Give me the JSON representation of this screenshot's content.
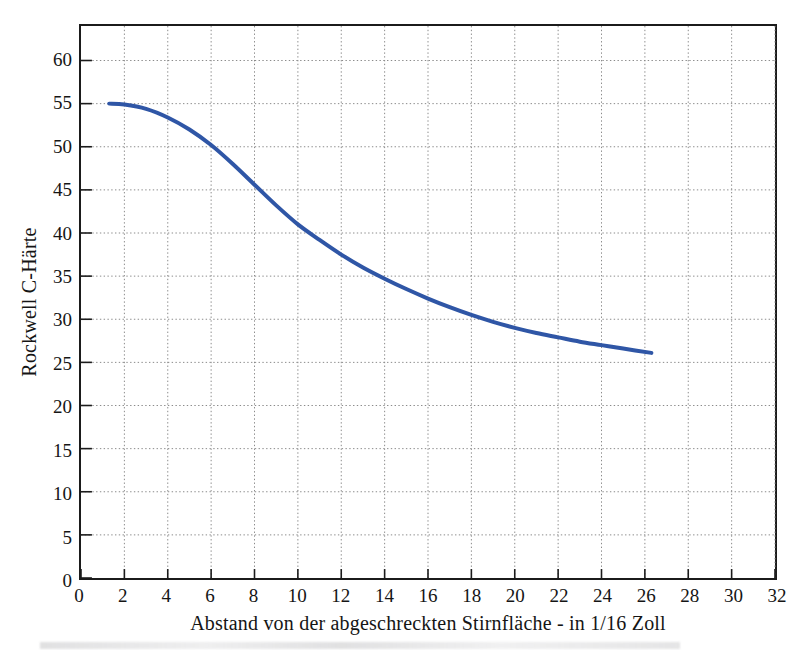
{
  "chart_data": {
    "type": "line",
    "title": "",
    "xlabel": "Abstand von der abgeschreckten Stirnfläche - in 1/16 Zoll",
    "ylabel": "Rockwell C-Härte",
    "xlim": [
      0,
      32
    ],
    "ylim": [
      0,
      64
    ],
    "xticks": [
      0,
      2,
      4,
      6,
      8,
      10,
      12,
      14,
      16,
      18,
      20,
      22,
      24,
      26,
      28,
      30,
      32
    ],
    "yticks": [
      0,
      5,
      10,
      15,
      20,
      25,
      30,
      35,
      40,
      45,
      50,
      55,
      60
    ],
    "grid": true,
    "grid_style": "dotted",
    "legend": "none",
    "series": [
      {
        "name": "Jominy-Härteverlauf",
        "color": "#2f56a6",
        "line_width": 4,
        "x": [
          1.3,
          2,
          3,
          4,
          5,
          6,
          7,
          8,
          9,
          10,
          11,
          12,
          13,
          14,
          15,
          16,
          17,
          18,
          19,
          20,
          21,
          22,
          23,
          24,
          25,
          26.3
        ],
        "y": [
          55.0,
          54.9,
          54.4,
          53.4,
          52.0,
          50.2,
          48.0,
          45.6,
          43.2,
          41.0,
          39.2,
          37.5,
          36.0,
          34.7,
          33.5,
          32.4,
          31.4,
          30.5,
          29.7,
          29.0,
          28.4,
          27.9,
          27.4,
          27.0,
          26.6,
          26.1
        ]
      }
    ]
  },
  "axes": {
    "y_title": "Rockwell C-Härte",
    "x_title": "Abstand von der abgeschreckten Stirnfläche - in 1/16 Zoll",
    "x_tick_labels": [
      "0",
      "2",
      "4",
      "6",
      "8",
      "10",
      "12",
      "14",
      "16",
      "18",
      "20",
      "22",
      "24",
      "26",
      "28",
      "30",
      "32"
    ],
    "y_tick_labels": [
      "0",
      "5",
      "10",
      "15",
      "20",
      "25",
      "30",
      "35",
      "40",
      "45",
      "50",
      "55",
      "60"
    ]
  },
  "colors": {
    "curve": "#2f56a6",
    "frame": "#1b1b1b",
    "grid": "#8a8a8a",
    "text": "#151515",
    "background": "#ffffff"
  }
}
